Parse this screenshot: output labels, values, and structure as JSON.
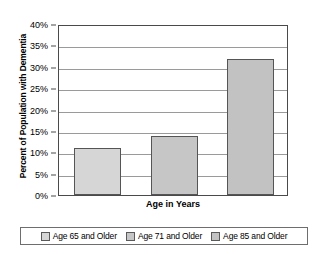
{
  "chart_data": {
    "type": "bar",
    "title": "",
    "subtitle": "",
    "xlabel": "Age in Years",
    "ylabel": "Percent of Population with Dementia",
    "categories": [
      "Age 65 and Older",
      "Age 71 and Older",
      "Age 85 and Older"
    ],
    "values": [
      11.0,
      13.8,
      31.8
    ],
    "series": [
      {
        "name": "Percent of Population with Dementia",
        "values": [
          11.0,
          13.8,
          31.8
        ]
      }
    ],
    "ylim": [
      0,
      40
    ],
    "ytick_values": [
      0,
      5,
      10,
      15,
      20,
      25,
      30,
      35,
      40
    ],
    "ytick_labels": [
      "0%",
      "5%",
      "10%",
      "15%",
      "20%",
      "25%",
      "30%",
      "35%",
      "40%"
    ],
    "xtick_labels": [],
    "grid": true,
    "grid_axis": "y",
    "legend_position": "bottom",
    "legend_entries": [
      {
        "label": "Age 65 and Older",
        "color": "#d6d6d6"
      },
      {
        "label": "Age 71 and Older",
        "color": "#c6c6c6"
      },
      {
        "label": "Age 85 and Older",
        "color": "#c2c2c2"
      }
    ],
    "bar_edge_color": "#555555",
    "axis_color": "#4a4a4a",
    "gridline_color": "#9a9a9a",
    "plot_background": "#ffffff"
  }
}
